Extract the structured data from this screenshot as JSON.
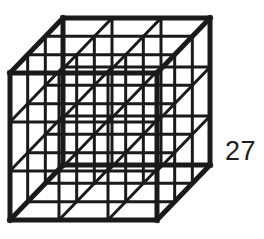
{
  "figure": {
    "label": "27",
    "label_meaning": "total number of unit cubes",
    "stroke_color": "#1a1a1a",
    "background_color": "#ffffff",
    "outline_stroke_width": 5,
    "interior_stroke_width": 3,
    "divisions_per_edge": 3,
    "unit_cube_count": 27
  },
  "chart_data": {
    "type": "diagram",
    "title": "27",
    "subtitle": "",
    "xlabel": "",
    "ylabel": "",
    "geometry": {
      "projection": "oblique",
      "front_face_origin": [
        10,
        73
      ],
      "front_face_size": 147,
      "cell_size": 49,
      "depth_offset": [
        53,
        -55
      ],
      "divisions": 3,
      "grid_lines_per_face": 4,
      "faces": [
        "front",
        "back",
        "left",
        "right",
        "top",
        "bottom"
      ],
      "vertices": {
        "front_top_left": [
          10,
          73
        ],
        "front_top_right": [
          157,
          73
        ],
        "front_bottom_left": [
          10,
          220
        ],
        "front_bottom_right": [
          157,
          220
        ],
        "back_top_left": [
          63,
          18
        ],
        "back_top_right": [
          210,
          18
        ],
        "back_bottom_left": [
          63,
          165
        ],
        "back_bottom_right": [
          210,
          165
        ]
      }
    },
    "values": [
      27
    ],
    "categories": [
      "unit cubes"
    ],
    "annotations": [
      {
        "text": "27",
        "position": [
          237,
          152
        ],
        "role": "count-label"
      }
    ]
  }
}
